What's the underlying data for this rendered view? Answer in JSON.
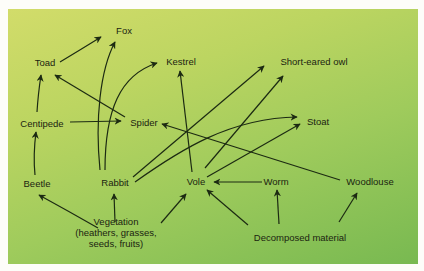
{
  "diagram": {
    "type": "food-web",
    "background": {
      "top_left": "#d2dc6a",
      "bottom_right": "#78b951"
    },
    "line_color": "#1c2a12",
    "nodes": {
      "fox": "Fox",
      "toad": "Toad",
      "kestrel": "Kestrel",
      "short_eared_owl": "Short-eared owl",
      "centipede": "Centipede",
      "spider": "Spider",
      "stoat": "Stoat",
      "beetle": "Beetle",
      "rabbit": "Rabbit",
      "vole": "Vole",
      "worm": "Worm",
      "woodlouse": "Woodlouse",
      "vegetation": "Vegetation",
      "vegetation_detail_1": "(heathers, grasses,",
      "vegetation_detail_2": "seeds, fruits)",
      "decomposed_material": "Decomposed material"
    },
    "edges": [
      {
        "from": "Toad",
        "to": "Fox"
      },
      {
        "from": "Rabbit",
        "to": "Fox"
      },
      {
        "from": "Rabbit",
        "to": "Kestrel"
      },
      {
        "from": "Centipede",
        "to": "Toad"
      },
      {
        "from": "Spider",
        "to": "Toad"
      },
      {
        "from": "Centipede",
        "to": "Spider"
      },
      {
        "from": "Beetle",
        "to": "Centipede"
      },
      {
        "from": "Vole",
        "to": "Kestrel"
      },
      {
        "from": "Rabbit",
        "to": "Short-eared owl"
      },
      {
        "from": "Vole",
        "to": "Short-eared owl"
      },
      {
        "from": "Rabbit",
        "to": "Stoat"
      },
      {
        "from": "Vole",
        "to": "Stoat"
      },
      {
        "from": "Woodlouse",
        "to": "Spider"
      },
      {
        "from": "Worm",
        "to": "Vole"
      },
      {
        "from": "Vegetation",
        "to": "Beetle"
      },
      {
        "from": "Vegetation",
        "to": "Rabbit"
      },
      {
        "from": "Vegetation",
        "to": "Vole"
      },
      {
        "from": "Decomposed material",
        "to": "Vole"
      },
      {
        "from": "Decomposed material",
        "to": "Worm"
      },
      {
        "from": "Decomposed material",
        "to": "Woodlouse"
      }
    ]
  }
}
